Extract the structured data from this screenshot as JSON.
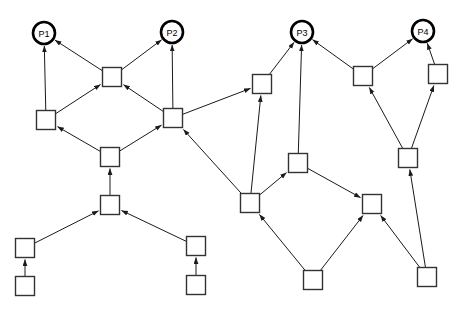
{
  "diagram": {
    "canvas": {
      "width": 466,
      "height": 314,
      "background": "#ffffff"
    },
    "style": {
      "edge_color": "#1a1a1a",
      "square_stroke": "#333333",
      "square_fill": "#ffffff",
      "circle_stroke": "#000000",
      "circle_fill": "#ffffff",
      "arrowhead": "filled-triangle"
    },
    "nodes": [
      {
        "id": "P1",
        "label": "P1",
        "shape": "circle",
        "x": 44,
        "y": 33,
        "r": 11
      },
      {
        "id": "P2",
        "label": "P2",
        "shape": "circle",
        "x": 172,
        "y": 32,
        "r": 11
      },
      {
        "id": "P3",
        "label": "P3",
        "shape": "circle",
        "x": 302,
        "y": 32,
        "r": 11
      },
      {
        "id": "P4",
        "label": "P4",
        "shape": "circle",
        "x": 423,
        "y": 31,
        "r": 11
      },
      {
        "id": "s1",
        "label": "",
        "shape": "square",
        "x": 112,
        "y": 77,
        "size": 19
      },
      {
        "id": "s2",
        "label": "",
        "shape": "square",
        "x": 46,
        "y": 120,
        "size": 19
      },
      {
        "id": "s3",
        "label": "",
        "shape": "square",
        "x": 173,
        "y": 118,
        "size": 19
      },
      {
        "id": "s4",
        "label": "",
        "shape": "square",
        "x": 110,
        "y": 157,
        "size": 19
      },
      {
        "id": "s5",
        "label": "",
        "shape": "square",
        "x": 110,
        "y": 205,
        "size": 19
      },
      {
        "id": "s6",
        "label": "",
        "shape": "square",
        "x": 25,
        "y": 248,
        "size": 19
      },
      {
        "id": "s7",
        "label": "",
        "shape": "square",
        "x": 25,
        "y": 286,
        "size": 19
      },
      {
        "id": "s8",
        "label": "",
        "shape": "square",
        "x": 196,
        "y": 246,
        "size": 19
      },
      {
        "id": "s9",
        "label": "",
        "shape": "square",
        "x": 196,
        "y": 285,
        "size": 19
      },
      {
        "id": "s10",
        "label": "",
        "shape": "square",
        "x": 262,
        "y": 84,
        "size": 19
      },
      {
        "id": "s11",
        "label": "",
        "shape": "square",
        "x": 298,
        "y": 163,
        "size": 19
      },
      {
        "id": "s12",
        "label": "",
        "shape": "square",
        "x": 250,
        "y": 203,
        "size": 19
      },
      {
        "id": "s13",
        "label": "",
        "shape": "square",
        "x": 372,
        "y": 204,
        "size": 19
      },
      {
        "id": "s14",
        "label": "",
        "shape": "square",
        "x": 313,
        "y": 280,
        "size": 19
      },
      {
        "id": "s15",
        "label": "",
        "shape": "square",
        "x": 363,
        "y": 76,
        "size": 19
      },
      {
        "id": "s16",
        "label": "",
        "shape": "square",
        "x": 438,
        "y": 74,
        "size": 19
      },
      {
        "id": "s17",
        "label": "",
        "shape": "square",
        "x": 408,
        "y": 158,
        "size": 19
      },
      {
        "id": "s18",
        "label": "",
        "shape": "square",
        "x": 427,
        "y": 277,
        "size": 19
      }
    ],
    "edges": [
      {
        "from": "s2",
        "to": "P1",
        "arrow": true
      },
      {
        "from": "s1",
        "to": "P1",
        "arrow": true
      },
      {
        "from": "s1",
        "to": "P2",
        "arrow": true
      },
      {
        "from": "s3",
        "to": "P2",
        "arrow": true
      },
      {
        "from": "s2",
        "to": "s1",
        "arrow": true
      },
      {
        "from": "s3",
        "to": "s1",
        "arrow": true
      },
      {
        "from": "s4",
        "to": "s2",
        "arrow": true
      },
      {
        "from": "s4",
        "to": "s3",
        "arrow": true
      },
      {
        "from": "s5",
        "to": "s4",
        "arrow": true
      },
      {
        "from": "s6",
        "to": "s5",
        "arrow": true
      },
      {
        "from": "s8",
        "to": "s5",
        "arrow": true
      },
      {
        "from": "s7",
        "to": "s6",
        "arrow": true
      },
      {
        "from": "s9",
        "to": "s8",
        "arrow": true
      },
      {
        "from": "s3",
        "to": "s10",
        "arrow": true
      },
      {
        "from": "s12",
        "to": "s3",
        "arrow": true
      },
      {
        "from": "s10",
        "to": "P3",
        "arrow": true
      },
      {
        "from": "s11",
        "to": "P3",
        "arrow": true
      },
      {
        "from": "s15",
        "to": "P3",
        "arrow": true
      },
      {
        "from": "s12",
        "to": "s10",
        "arrow": true
      },
      {
        "from": "s12",
        "to": "s11",
        "arrow": true
      },
      {
        "from": "s14",
        "to": "s12",
        "arrow": true
      },
      {
        "from": "s11",
        "to": "s13",
        "arrow": true
      },
      {
        "from": "s14",
        "to": "s13",
        "arrow": true
      },
      {
        "from": "s18",
        "to": "s13",
        "arrow": true
      },
      {
        "from": "s15",
        "to": "P4",
        "arrow": true
      },
      {
        "from": "s16",
        "to": "P4",
        "arrow": true
      },
      {
        "from": "s17",
        "to": "s15",
        "arrow": true
      },
      {
        "from": "s17",
        "to": "s16",
        "arrow": true
      },
      {
        "from": "s18",
        "to": "s17",
        "arrow": true
      }
    ]
  }
}
